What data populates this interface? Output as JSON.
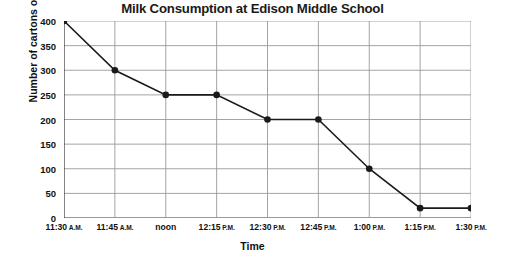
{
  "chart_data": {
    "type": "line",
    "title": "Milk Consumption at Edison Middle School",
    "xlabel": "Time",
    "ylabel": "Number of cartons of milk left",
    "categories": [
      "11:30 A.M.",
      "11:45 A.M.",
      "noon",
      "12:15 P.M.",
      "12:30 P.M.",
      "12:45 P.M.",
      "1:00 P.M.",
      "1:15 P.M.",
      "1:30 P.M."
    ],
    "category_parts": [
      {
        "time": "11:30",
        "meridiem": "A.M."
      },
      {
        "time": "11:45",
        "meridiem": "A.M."
      },
      {
        "time": "noon",
        "meridiem": ""
      },
      {
        "time": "12:15",
        "meridiem": "P.M."
      },
      {
        "time": "12:30",
        "meridiem": "P.M."
      },
      {
        "time": "12:45",
        "meridiem": "P.M."
      },
      {
        "time": "1:00",
        "meridiem": "P.M."
      },
      {
        "time": "1:15",
        "meridiem": "P.M."
      },
      {
        "time": "1:30",
        "meridiem": "P.M."
      }
    ],
    "values": [
      400,
      300,
      250,
      250,
      200,
      200,
      100,
      20,
      20
    ],
    "ylim": [
      0,
      400
    ],
    "yticks": [
      0,
      50,
      100,
      150,
      200,
      250,
      300,
      350,
      400
    ],
    "ytick_labels": [
      "0",
      "50",
      "100",
      "150",
      "200",
      "250",
      "300",
      "350",
      "400"
    ],
    "grid": true,
    "legend": "none",
    "line_color": "#1a1a1a",
    "marker_color": "#1a1a1a",
    "grid_color": "#9a9a9a",
    "background": "#ffffff"
  }
}
